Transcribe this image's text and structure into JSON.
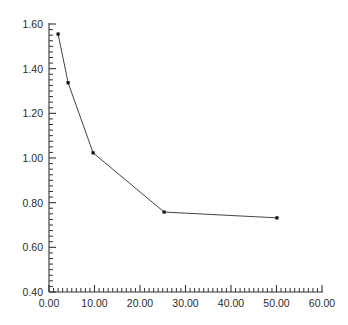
{
  "chart_data": {
    "type": "line",
    "title": "",
    "xlabel": "",
    "ylabel": "",
    "xlim": [
      0.0,
      60.0
    ],
    "ylim": [
      0.4,
      1.6
    ],
    "xticks": [
      0.0,
      10.0,
      20.0,
      30.0,
      40.0,
      50.0,
      60.0
    ],
    "xtick_labels": [
      "0.00",
      "10.00",
      "20.00",
      "30.00",
      "40.00",
      "50.00",
      "60.00"
    ],
    "yticks": [
      0.4,
      0.6,
      0.8,
      1.0,
      1.2,
      1.4,
      1.6
    ],
    "ytick_labels": [
      "0.40",
      "0.60",
      "0.80",
      "1.00",
      "1.20",
      "1.40",
      "1.60"
    ],
    "x_minor_tick_interval": 1.0,
    "y_minor_tick_interval": 0.025,
    "grid": false,
    "legend": false,
    "legend_position": "none",
    "line_color": "#444444",
    "marker_color": "#111111",
    "marker_style": "point",
    "axis_color": "#333333",
    "background_color": "#ffffff",
    "series": [
      {
        "name": "series-1",
        "x": [
          2.0,
          4.2,
          9.7,
          25.3,
          50.1
        ],
        "values": [
          1.555,
          1.337,
          1.023,
          0.758,
          0.732
        ]
      }
    ]
  }
}
